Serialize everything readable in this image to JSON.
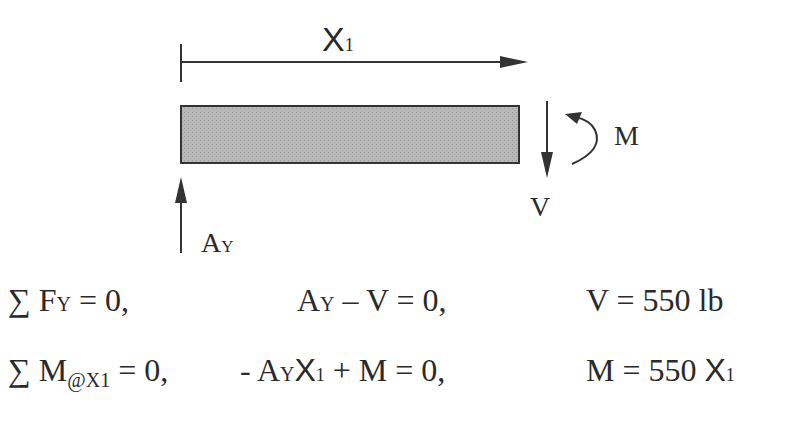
{
  "diagram": {
    "type": "free-body diagram (beam section)",
    "labels": {
      "distance": {
        "main": "X",
        "sub": "1"
      },
      "moment": "M",
      "shear": "V",
      "reaction": {
        "main": "A",
        "sub": "Y"
      }
    },
    "colors": {
      "beam_fill": "#b4b4b4",
      "stroke": "#333333",
      "text": "#2a2a2a"
    }
  },
  "equations": [
    {
      "condition": {
        "sigma": "∑",
        "var": "F",
        "sub": "Y",
        "rest": " = 0,"
      },
      "equation": {
        "parts": [
          {
            "t": "A"
          },
          {
            "s": "Y"
          },
          {
            "t": " – V = 0,"
          }
        ]
      },
      "result": {
        "text": "V = 550 lb"
      }
    },
    {
      "condition": {
        "sigma": "∑",
        "var": "M",
        "sub": "@X1",
        "rest": " = 0,"
      },
      "equation": {
        "parts": [
          {
            "t": "- A"
          },
          {
            "s": "Y"
          },
          {
            "x": "X"
          },
          {
            "xs": "1"
          },
          {
            "t": " + M = 0,"
          }
        ]
      },
      "result": {
        "text": "M = 550 ",
        "x": "X",
        "xs": "1"
      }
    }
  ],
  "strings": {
    "eq1_cond_sigma": "∑",
    "eq1_cond_var": "F",
    "eq1_cond_sub": "Y",
    "eq1_cond_rest": " = 0,",
    "eq1_mid_a": "A",
    "eq1_mid_sub": "Y",
    "eq1_mid_rest": " – V = 0,",
    "eq1_result": "V = 550 lb",
    "eq2_cond_sigma": "∑",
    "eq2_cond_var": "M",
    "eq2_cond_sub": "@X1",
    "eq2_cond_rest": " = 0,",
    "eq2_mid_pre": "- A",
    "eq2_mid_sub": "Y",
    "eq2_mid_x": "X",
    "eq2_mid_xsub": "1",
    "eq2_mid_rest": " + M = 0,",
    "eq2_result_pre": "M = 550 ",
    "eq2_result_x": "X",
    "eq2_result_xsub": "1"
  }
}
